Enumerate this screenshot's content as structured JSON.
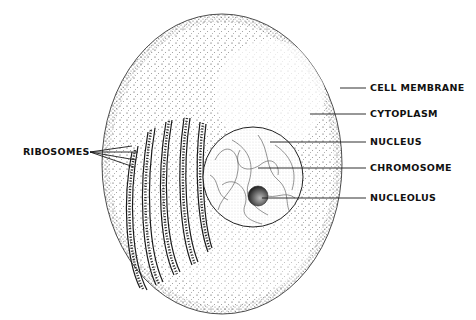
{
  "diagram": {
    "type": "cell-anatomy",
    "labels": {
      "cell_membrane": "CELL  MEMBRANE",
      "cytoplasm": "CYTOPLASM",
      "nucleus": "NUCLEUS",
      "chromosome": "CHROMOSOME",
      "nucleolus": "NUCLEOLUS",
      "ribosomes": "RIBOSOMES"
    },
    "colors": {
      "ink": "#1a1a1a",
      "background": "#ffffff"
    }
  }
}
